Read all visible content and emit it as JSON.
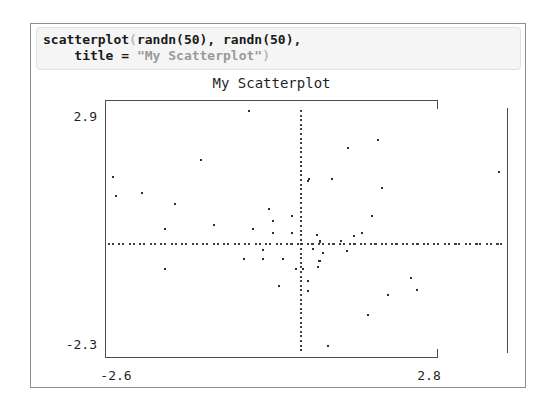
{
  "window": {
    "background": "#ffffff",
    "border_color": "#8f8f8f"
  },
  "code_editor": {
    "background": "#f5f5f5",
    "border_color": "#e1e1e1",
    "text_color": "#1a1a1a",
    "string_color": "#9a9a9a",
    "dim_paren_color": "#b9b9b9",
    "line1": {
      "func": "scatterplot",
      "open_paren": "(",
      "args": "randn(50), randn(50),"
    },
    "line2": {
      "lhs": "    title = ",
      "string": "\"My Scatterplot\"",
      "close_paren": ")"
    }
  },
  "chart_data": {
    "type": "scatter",
    "title": "My Scatterplot",
    "xlabel": "",
    "ylabel": "",
    "xlim": [
      -2.6,
      2.8
    ],
    "ylim": [
      -2.3,
      2.9
    ],
    "x_tick_left": "-2.6",
    "x_tick_right": "2.8",
    "y_tick_top": "2.9",
    "y_tick_bottom": "-2.3",
    "grid": false,
    "zero_lines": "dotted",
    "legend": "none",
    "point_color": "#2e2e2e",
    "axis_color": "#4d4d4d",
    "n_points_declared": 50,
    "points": [
      [
        -0.71,
        2.92
      ],
      [
        -1.38,
        1.84
      ],
      [
        -2.61,
        1.46
      ],
      [
        -2.2,
        1.11
      ],
      [
        -2.57,
        1.04
      ],
      [
        -1.74,
        0.86
      ],
      [
        -0.43,
        0.75
      ],
      [
        -0.11,
        0.6
      ],
      [
        -0.38,
        0.49
      ],
      [
        -1.2,
        0.4
      ],
      [
        -1.88,
        0.31
      ],
      [
        -0.66,
        0.31
      ],
      [
        -0.38,
        0.22
      ],
      [
        -0.11,
        0.22
      ],
      [
        0.11,
        1.37
      ],
      [
        1.09,
        2.28
      ],
      [
        0.67,
        2.1
      ],
      [
        2.78,
        1.57
      ],
      [
        0.13,
        1.42
      ],
      [
        0.45,
        1.42
      ],
      [
        1.14,
        1.22
      ],
      [
        1.0,
        0.6
      ],
      [
        0.86,
        0.22
      ],
      [
        0.24,
        0.18
      ],
      [
        0.75,
        0.15
      ],
      [
        0.28,
        0.03
      ],
      [
        0.57,
        0.05
      ],
      [
        -0.52,
        -0.15
      ],
      [
        -0.78,
        -0.35
      ],
      [
        -0.52,
        -0.35
      ],
      [
        -0.24,
        -0.35
      ],
      [
        -1.88,
        -0.58
      ],
      [
        -0.29,
        -0.95
      ],
      [
        0.18,
        -0.13
      ],
      [
        0.66,
        -0.18
      ],
      [
        0.32,
        -0.22
      ],
      [
        0.27,
        -0.4
      ],
      [
        0.25,
        -0.53
      ],
      [
        -0.06,
        -0.58
      ],
      [
        0.04,
        -0.58
      ],
      [
        0.11,
        -0.84
      ],
      [
        0.11,
        -1.06
      ],
      [
        1.55,
        -0.77
      ],
      [
        1.63,
        -1.04
      ],
      [
        1.23,
        -1.15
      ],
      [
        0.95,
        -1.59
      ],
      [
        0.39,
        -2.28
      ]
    ]
  }
}
